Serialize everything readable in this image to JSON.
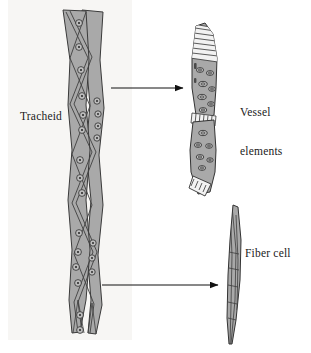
{
  "figure": {
    "background_color": "#ffffff",
    "panel_color": "#f7f6f4",
    "cell_fill_color": "#a9a9a9",
    "cell_outline_color": "#3a3a3a",
    "arrow_color": "#111111",
    "text_color": "#1a1a1a"
  },
  "labels": {
    "tracheid": "Tracheid",
    "vessel_line1": "Vessel",
    "vessel_line2": "elements",
    "fiber": "Fiber cell"
  },
  "structures": [
    {
      "name": "tracheid",
      "label": "Tracheid",
      "description": "Two long overlapping tapered tracheid cells with bordered pits",
      "pit_type": "bordered pit",
      "pit_count": 22
    },
    {
      "name": "vessel-elements",
      "label": "Vessel elements",
      "description": "Two stacked vessel elements joined by scalariform perforation plates",
      "pit_type": "oval pit",
      "perforation_plates": 3
    },
    {
      "name": "fiber-cell",
      "label": "Fiber cell",
      "description": "Long slender spindle-shaped fiber cell with tapered ends"
    }
  ],
  "arrows": [
    {
      "name": "arrow-to-vessel-elements",
      "from": "tracheid",
      "to": "vessel elements"
    },
    {
      "name": "arrow-to-fiber-cell",
      "from": "tracheid",
      "to": "fiber cell"
    }
  ]
}
